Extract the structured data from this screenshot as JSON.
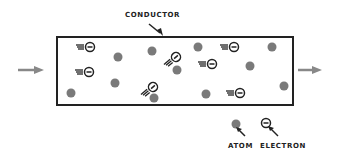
{
  "title": "CONDUCTOR",
  "legend": {
    "atom_label": "ATOM",
    "electron_label": "ELECTRON"
  },
  "colors": {
    "atom": "#7a7a7a",
    "outline": "#222222",
    "arrow": "#888888"
  },
  "atoms": [
    [
      118,
      57
    ],
    [
      152,
      51
    ],
    [
      71,
      93
    ],
    [
      115,
      83
    ],
    [
      198,
      47
    ],
    [
      177,
      70
    ],
    [
      250,
      66
    ],
    [
      272,
      47
    ],
    [
      206,
      94
    ],
    [
      284,
      86
    ],
    [
      154,
      98
    ]
  ],
  "electrons": [
    {
      "x": 90,
      "y": 47,
      "dir": "h"
    },
    {
      "x": 89,
      "y": 72,
      "dir": "h"
    },
    {
      "x": 234,
      "y": 47,
      "dir": "h"
    },
    {
      "x": 212,
      "y": 64,
      "dir": "h"
    },
    {
      "x": 240,
      "y": 93,
      "dir": "h"
    },
    {
      "x": 176,
      "y": 57,
      "dir": "d"
    },
    {
      "x": 153,
      "y": 87,
      "dir": "d"
    }
  ]
}
